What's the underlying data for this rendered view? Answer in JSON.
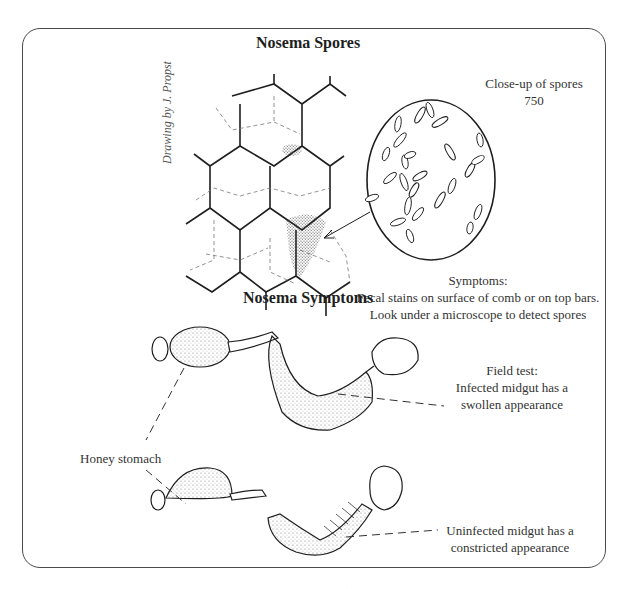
{
  "diagram": {
    "section_spores": {
      "title": "Nosema Spores",
      "credit": "Drawing by J. Propst",
      "closeup_label": "Close-up of spores",
      "magnification": "750",
      "symptoms_heading": "Symptoms:",
      "symptoms_line1": "Fecal stains on surface of comb or on top bars.",
      "symptoms_line2": "Look under a microscope to detect spores"
    },
    "section_symptoms": {
      "title": "Nosema Symptoms",
      "honey_stomach_label": "Honey stomach",
      "field_test_heading": "Field test:",
      "infected_line1": "Infected midgut has a",
      "infected_line2": "swollen appearance",
      "uninfected_line1": "Uninfected midgut has a",
      "uninfected_line2": "constricted appearance"
    },
    "colors": {
      "border": "#4a4a4a",
      "ink": "#1e1e1e",
      "stipple": "#555555"
    }
  }
}
